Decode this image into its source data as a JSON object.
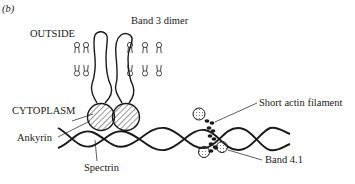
{
  "figure": {
    "panel_label": "(b)",
    "labels": {
      "outside": "OUTSIDE",
      "band3": "Band 3 dimer",
      "cytoplasm": "CYTOPLASM",
      "ankyrin": "Ankyrin",
      "spectrin": "Spectrin",
      "actin": "Short actin filament",
      "band41": "Band 4.1"
    },
    "colors": {
      "ink": "#1a1a1a",
      "background": "#ffffff"
    }
  }
}
